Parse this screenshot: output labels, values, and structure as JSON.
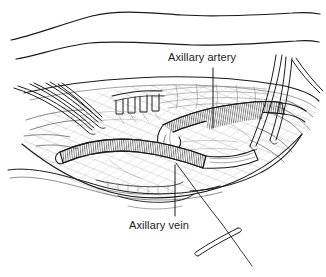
{
  "figure": {
    "kind": "surgical-line-illustration",
    "title_visible": false,
    "background_color": "#ffffff",
    "ink_color": "#1a1a1a",
    "hatch_color": "#5a5a5a",
    "labels": {
      "artery": "Axillary artery",
      "vein": "Axillary vein"
    },
    "anatomy": [
      {
        "name": "axillary-artery",
        "description": "upper cross-hatched tubular vessel running left-to-right"
      },
      {
        "name": "axillary-vein",
        "description": "lower cross-hatched tubular vessel running left-to-right"
      },
      {
        "name": "vessel-loop-anastomosis",
        "description": "looped vessel segment joining the two vessels at center"
      },
      {
        "name": "skin-contour-upper",
        "description": "uppermost flowing skin contour line"
      },
      {
        "name": "skin-contour-lower",
        "description": "second flowing skin contour line"
      },
      {
        "name": "wound-cavity",
        "description": "open surgical wound bed with hatched fascial tissue"
      },
      {
        "name": "tissue-edge-lower",
        "description": "lower wound edge with fine hatching"
      }
    ],
    "instruments": [
      {
        "name": "retractor-prongs-left",
        "description": "three to four slender retractor prongs entering from upper left"
      },
      {
        "name": "toothed-retractor-center",
        "description": "comb-like retractor with rectangular teeth at upper center"
      },
      {
        "name": "forceps-right",
        "description": "long paired forceps blades entering from upper right"
      },
      {
        "name": "suture-needle",
        "description": "curved suture needle at lower right"
      },
      {
        "name": "suture-thread",
        "description": "suture thread running from wound down to the needle"
      }
    ],
    "leader_lines": [
      {
        "name": "artery-leader",
        "from_label": "artery",
        "orientation": "vertical"
      },
      {
        "name": "vein-leader",
        "from_label": "vein",
        "orientation": "vertical"
      }
    ]
  }
}
